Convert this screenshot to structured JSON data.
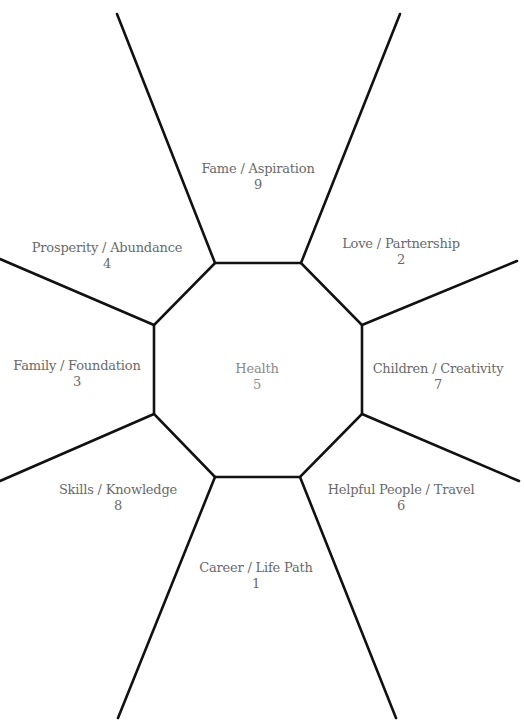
{
  "diagram": {
    "type": "bagua-map",
    "line_color": "#111111",
    "label_color": "#6a6a6a",
    "center_label_color": "#8a8a8a",
    "areas": [
      {
        "id": "fame",
        "name": "Fame / Aspiration",
        "number": "9"
      },
      {
        "id": "love",
        "name": "Love / Partnership",
        "number": "2"
      },
      {
        "id": "prosperity",
        "name": "Prosperity / Abundance",
        "number": "4"
      },
      {
        "id": "family",
        "name": "Family / Foundation",
        "number": "3"
      },
      {
        "id": "health",
        "name": "Health",
        "number": "5"
      },
      {
        "id": "children",
        "name": "Children / Creativity",
        "number": "7"
      },
      {
        "id": "skills",
        "name": "Skills / Knowledge",
        "number": "8"
      },
      {
        "id": "helpful",
        "name": "Helpful People / Travel",
        "number": "6"
      },
      {
        "id": "career",
        "name": "Career / Life Path",
        "number": "1"
      }
    ]
  }
}
